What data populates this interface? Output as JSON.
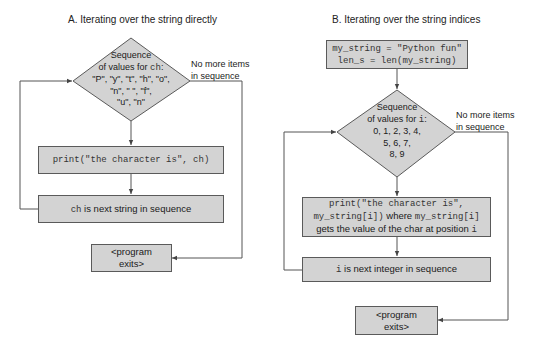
{
  "diagram_a": {
    "title": "A. Iterating over the string directly",
    "decision": {
      "line1": "Sequence",
      "line2_prefix": "of values for ",
      "line2_var": "ch",
      "line2_suffix": ":",
      "line3": "\"P\", \"y\", \"t\", \"h\", \"o\",",
      "line4": "\"n\", \" \", \"f\",",
      "line5": "\"u\", \"n\""
    },
    "exit_label_line1": "No more items",
    "exit_label_line2": "in sequence",
    "print_box": "print(\"the character is\", ch)",
    "next_box_var": "ch",
    "next_box_text": " is next string in sequence",
    "end_box_line1": "<program",
    "end_box_line2": "exits>"
  },
  "diagram_b": {
    "title": "B. Iterating over the string indices",
    "init_box_line1": "my_string = \"Python fun\"",
    "init_box_line2": "len_s = len(my_string)",
    "decision": {
      "line1": "Sequence",
      "line2_prefix": "of values for ",
      "line2_var": "i",
      "line2_suffix": ":",
      "line3": "0, 1, 2, 3, 4,",
      "line4": "5, 6, 7,",
      "line5": "8, 9"
    },
    "exit_label_line1": "No more items",
    "exit_label_line2": "in sequence",
    "print_box": {
      "line1": "print(\"the character is\",",
      "line2_code1": "my_string[i])",
      "line2_text": " where ",
      "line2_code2": "my_string[i]",
      "line3_text": "gets the value of the char at position ",
      "line3_code": "i"
    },
    "next_box_var": "i",
    "next_box_text": " is next integer in sequence",
    "end_box_line1": "<program",
    "end_box_line2": "exits>"
  },
  "colors": {
    "box_fill": "#d3d3d3",
    "box_border": "#5a5a5a",
    "line": "#555555"
  }
}
